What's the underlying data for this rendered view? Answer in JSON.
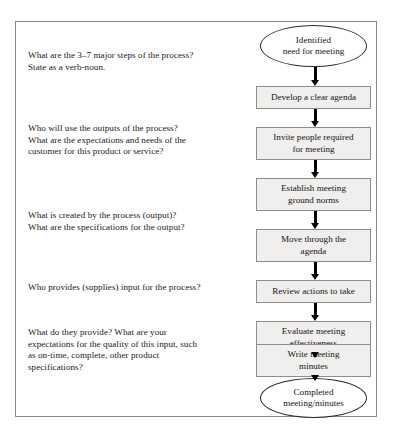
{
  "figure": {
    "left_column": {
      "questions": [
        {
          "id": "question-major-steps",
          "top": 28,
          "lines": [
            "What are the 3–7 major steps of the process?",
            "State as a verb-noun."
          ]
        },
        {
          "id": "question-outputs-customers",
          "top": 101,
          "lines": [
            "Who will use the outputs of the process?",
            "What are the expectations and needs of the",
            "customer for this product or service?"
          ]
        },
        {
          "id": "question-output-specifications",
          "top": 188,
          "lines": [
            "What is created by the process (output)?",
            "What are the specifications for the output?"
          ]
        },
        {
          "id": "question-suppliers",
          "top": 260,
          "lines": [
            "Who provides (supplies) input for the process?"
          ]
        },
        {
          "id": "question-input-quality",
          "top": 305,
          "lines": [
            "What do they provide? What are your",
            "expectations for the quality of this input, such",
            "as on-time, complete, other product",
            "specifications?"
          ]
        }
      ]
    },
    "flowchart": {
      "nodes": [
        {
          "id": "node-identified-need",
          "shape": "terminator",
          "label": "Identified\nneed for meeting",
          "lines": [
            "Identified",
            "need for meeting"
          ],
          "top": 3,
          "height": 42
        },
        {
          "id": "node-develop-agenda",
          "shape": "process",
          "label": "Develop a clear agenda",
          "lines": [
            "Develop a clear agenda"
          ],
          "top": 64,
          "height": 23
        },
        {
          "id": "node-invite-people",
          "shape": "process",
          "label": "Invite people required for meeting",
          "lines": [
            "Invite people required",
            "for meeting"
          ],
          "top": 105,
          "height": 33
        },
        {
          "id": "node-establish-ground-norms",
          "shape": "process",
          "label": "Establish meeting ground norms",
          "lines": [
            "Establish meeting",
            "ground norms"
          ],
          "top": 156,
          "height": 33
        },
        {
          "id": "node-move-through-agenda",
          "shape": "process",
          "label": "Move through the agenda",
          "lines": [
            "Move through the",
            "agenda"
          ],
          "top": 207,
          "height": 33
        },
        {
          "id": "node-review-actions",
          "shape": "process",
          "label": "Review actions to take",
          "lines": [
            "Review actions to take"
          ],
          "top": 258,
          "height": 23
        },
        {
          "id": "node-evaluate-effectiveness",
          "shape": "process",
          "label": "Evaluate meeting effectiveness",
          "lines": [
            "Evaluate meeting",
            "effectiveness"
          ],
          "top": 299,
          "height": 33
        },
        {
          "id": "node-write-minutes",
          "shape": "process",
          "label": "Write meeting minutes",
          "lines": [
            "Write meeting",
            "minutes"
          ],
          "top": 322,
          "height": 33
        },
        {
          "id": "node-completed-minutes",
          "shape": "terminator",
          "label": "Completed\nmeeting/minutes",
          "lines": [
            "Completed",
            "meeting/minutes"
          ],
          "top": 356,
          "height": 40
        }
      ],
      "arrows": [
        {
          "id": "arrow-1",
          "from": "node-identified-need",
          "to": "node-develop-agenda"
        },
        {
          "id": "arrow-2",
          "from": "node-develop-agenda",
          "to": "node-invite-people"
        },
        {
          "id": "arrow-3",
          "from": "node-invite-people",
          "to": "node-establish-ground-norms"
        },
        {
          "id": "arrow-4",
          "from": "node-establish-ground-norms",
          "to": "node-move-through-agenda"
        },
        {
          "id": "arrow-5",
          "from": "node-move-through-agenda",
          "to": "node-review-actions"
        },
        {
          "id": "arrow-6",
          "from": "node-review-actions",
          "to": "node-evaluate-effectiveness"
        },
        {
          "id": "arrow-7",
          "from": "node-evaluate-effectiveness",
          "to": "node-write-minutes"
        },
        {
          "id": "arrow-8",
          "from": "node-write-minutes",
          "to": "node-completed-minutes"
        }
      ]
    },
    "colors": {
      "process_fill": "#f0efed",
      "process_stroke": "#8d8d8d",
      "terminator_fill": "#ffffff",
      "terminator_stroke": "#2b2b2b",
      "arrow": "#000000",
      "panel_border": "#8a8a8a",
      "text": "#1a1a1a"
    }
  }
}
